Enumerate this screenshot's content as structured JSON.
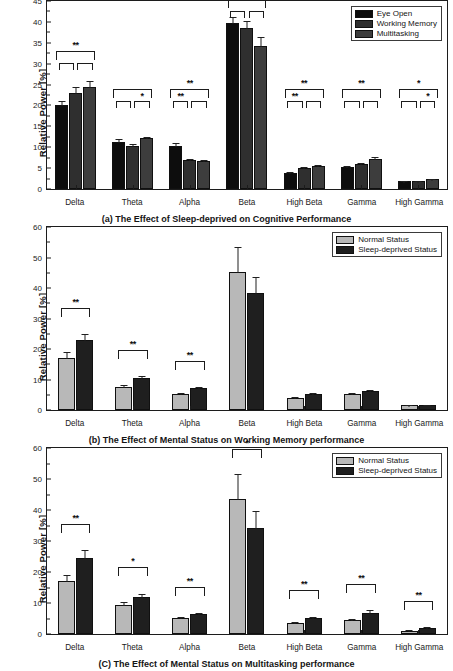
{
  "figure": {
    "ylabel": "Relative Power [%]"
  },
  "panels": [
    {
      "id": "a",
      "caption": "(a) The Effect of Sleep-deprived on Cognitive Performance",
      "ylabel": "Relative Power [%]",
      "legend": [
        {
          "label": "Eye Open",
          "color": "#0d0d0d"
        },
        {
          "label": "Working Memory",
          "color": "#2f2f2f"
        },
        {
          "label": "Multitasking",
          "color": "#3d3d3d"
        }
      ],
      "chart_data": {
        "type": "bar",
        "title": "(a) The Effect of Sleep-deprived on Cognitive Performance",
        "xlabel": "",
        "ylabel": "Relative Power [%]",
        "ylim": [
          0,
          45
        ],
        "ytick_step": 5,
        "grid": false,
        "legend_position": "top-right",
        "categories": [
          "Delta",
          "Theta",
          "Alpha",
          "Beta",
          "High Beta",
          "Gamma",
          "High Gamma"
        ],
        "series": [
          {
            "name": "Eye Open",
            "values": [
              20.1,
              11.3,
              10.4,
              39.8,
              3.9,
              5.2,
              1.8
            ],
            "errors": [
              1.0,
              0.6,
              0.5,
              1.3,
              0.25,
              0.3,
              0.12
            ]
          },
          {
            "name": "Working Memory",
            "values": [
              22.9,
              10.2,
              7.0,
              38.5,
              5.0,
              5.9,
              1.8
            ],
            "errors": [
              1.5,
              0.6,
              0.25,
              1.6,
              0.3,
              0.35,
              0.12
            ]
          },
          {
            "name": "Multitasking",
            "values": [
              24.4,
              12.1,
              6.7,
              34.2,
              5.5,
              7.1,
              2.3
            ],
            "errors": [
              1.4,
              0.35,
              0.2,
              2.1,
              0.3,
              0.45,
              0.2
            ]
          }
        ],
        "annotations": [
          {
            "category": "Delta",
            "outer": "**",
            "inner_left": "",
            "inner_right": ""
          },
          {
            "category": "Theta",
            "outer": "",
            "inner_left": "",
            "inner_right": "*"
          },
          {
            "category": "Alpha",
            "outer": "**",
            "inner_left": "**",
            "inner_right": ""
          },
          {
            "category": "Beta",
            "outer": "*",
            "inner_left": "",
            "inner_right": ""
          },
          {
            "category": "High Beta",
            "outer": "**",
            "inner_left": "**",
            "inner_right": ""
          },
          {
            "category": "Gamma",
            "outer": "**",
            "inner_left": "",
            "inner_right": ""
          },
          {
            "category": "High Gamma",
            "outer": "*",
            "inner_left": "",
            "inner_right": "*"
          }
        ]
      }
    },
    {
      "id": "b",
      "caption": "(b) The Effect of Mental Status on Working Memory performance",
      "ylabel": "Relative Power [%]",
      "legend": [
        {
          "label": "Normal Status",
          "color": "#b8b8b8"
        },
        {
          "label": "Sleep-deprived Status",
          "color": "#1f1f1f"
        }
      ],
      "chart_data": {
        "type": "bar",
        "title": "(b) The Effect of Mental Status on Working Memory performance",
        "xlabel": "",
        "ylabel": "Relative Power [%]",
        "ylim": [
          0,
          60
        ],
        "ytick_step": 10,
        "grid": false,
        "legend_position": "top-right",
        "categories": [
          "Delta",
          "Theta",
          "Alpha",
          "Beta",
          "High Beta",
          "Gamma",
          "High Gamma"
        ],
        "series": [
          {
            "name": "Normal Status",
            "values": [
              17.2,
              7.7,
              5.2,
              45.3,
              4.0,
              5.3,
              1.5
            ],
            "errors": [
              1.8,
              0.5,
              0.25,
              8.3,
              0.3,
              0.4,
              0.2
            ]
          },
          {
            "name": "Sleep-deprived Status",
            "values": [
              22.9,
              10.4,
              7.1,
              38.5,
              5.2,
              6.1,
              1.6
            ],
            "errors": [
              2.0,
              0.7,
              0.35,
              5.0,
              0.4,
              0.5,
              0.2
            ]
          }
        ],
        "annotations": [
          {
            "category": "Delta",
            "outer": "**"
          },
          {
            "category": "Theta",
            "outer": "**"
          },
          {
            "category": "Alpha",
            "outer": "**"
          }
        ]
      }
    },
    {
      "id": "c",
      "caption": "(C) The Effect of Mental Status on Multitasking performance",
      "ylabel": "Relative Power [%]",
      "legend": [
        {
          "label": "Normal Status",
          "color": "#b8b8b8"
        },
        {
          "label": "Sleep-deprived Status",
          "color": "#1f1f1f"
        }
      ],
      "chart_data": {
        "type": "bar",
        "title": "(C) The Effect of Mental Status on Multitasking performance",
        "xlabel": "",
        "ylabel": "Relative Power [%]",
        "ylim": [
          0,
          60
        ],
        "ytick_step": 10,
        "grid": false,
        "legend_position": "top-right",
        "categories": [
          "Delta",
          "Theta",
          "Alpha",
          "Beta",
          "High Beta",
          "Gamma",
          "High Gamma"
        ],
        "series": [
          {
            "name": "Normal Status",
            "values": [
              17.1,
              9.4,
              5.1,
              43.5,
              3.5,
              4.4,
              1.1
            ],
            "errors": [
              2.1,
              1.0,
              0.25,
              8.2,
              0.25,
              0.5,
              0.2
            ]
          },
          {
            "name": "Sleep-deprived Status",
            "values": [
              24.5,
              12.0,
              6.4,
              34.2,
              5.3,
              6.9,
              1.9
            ],
            "errors": [
              2.5,
              1.0,
              0.3,
              5.5,
              0.3,
              0.7,
              0.25
            ]
          }
        ],
        "annotations": [
          {
            "category": "Delta",
            "outer": "**"
          },
          {
            "category": "Theta",
            "outer": "*"
          },
          {
            "category": "Alpha",
            "outer": "**"
          },
          {
            "category": "Beta",
            "outer": "*"
          },
          {
            "category": "High Beta",
            "outer": "**"
          },
          {
            "category": "Gamma",
            "outer": "**"
          },
          {
            "category": "High Gamma",
            "outer": "**"
          }
        ]
      }
    }
  ]
}
